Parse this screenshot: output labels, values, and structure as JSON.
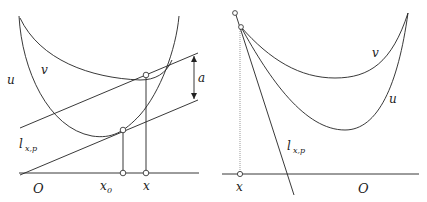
{
  "figure": {
    "left_panel": {
      "labels": {
        "u": "u",
        "v": "v",
        "a": "a",
        "line_main": "l",
        "line_sub": "x,p",
        "origin": "ᵊa",
        "origin_text": "O",
        "x0_main": "x",
        "x0_sub": "0",
        "x": "x"
      },
      "description": "Two convex curves u (steeper) and v (shallower); two parallel lines tangent to u at x0 and v at x, separated vertically by a; vertical drop lines to the axis at x0 and x."
    },
    "right_panel": {
      "labels": {
        "u": "u",
        "v": "v",
        "line_main": "l",
        "line_sub": "x,p",
        "origin_text": "O",
        "x": "x"
      },
      "description": "Curves v (upper) and u (lower) meeting at a common point at the left boundary x; steep line l_{x,p} through that point; dotted vertical from x to the axis."
    }
  }
}
